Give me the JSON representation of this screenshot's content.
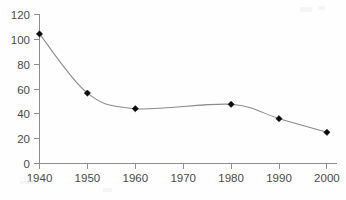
{
  "chart_data": {
    "type": "line",
    "title": "",
    "subtitle": "",
    "xlabel": "",
    "ylabel": "",
    "x": [
      1940,
      1950,
      1960,
      1980,
      1990,
      2000
    ],
    "values": [
      104,
      56.5,
      44,
      47.5,
      36,
      25
    ],
    "series": [
      {
        "name": "series-1",
        "x": [
          1940,
          1950,
          1960,
          1980,
          1990,
          2000
        ],
        "values": [
          104,
          56.5,
          44,
          47.5,
          36,
          25
        ]
      }
    ],
    "xlim": [
      1940,
      2000
    ],
    "ylim": [
      0,
      120
    ],
    "x_ticks": [
      1940,
      1950,
      1960,
      1970,
      1980,
      1990,
      2000
    ],
    "x_tick_labels": [
      "1940",
      "1950",
      "1960",
      "1970",
      "1980",
      "1990",
      "2000"
    ],
    "y_ticks": [
      0,
      20,
      40,
      60,
      80,
      100,
      120
    ],
    "y_tick_labels": [
      "0",
      "20",
      "40",
      "60",
      "80",
      "100",
      "120"
    ],
    "grid": false,
    "legend": null,
    "legend_position": "none",
    "annotations": [],
    "marker": "diamond",
    "line_smoothing": "smoothed",
    "colors": {
      "line": "#8a8a8a",
      "marker": "#0a0a0a",
      "axis": "#8d8d8d",
      "tick_label": "#4a4a4a",
      "background": "#fefefe"
    },
    "marker_points": [
      {
        "label": "1940",
        "x": 1940,
        "y": 104
      },
      {
        "label": "1950",
        "x": 1950,
        "y": 56.5
      },
      {
        "label": "1960",
        "x": 1960,
        "y": 44
      },
      {
        "label": "1980",
        "x": 1980,
        "y": 47.5
      },
      {
        "label": "1990",
        "x": 1990,
        "y": 36
      },
      {
        "label": "2000",
        "x": 2000,
        "y": 25
      }
    ]
  }
}
